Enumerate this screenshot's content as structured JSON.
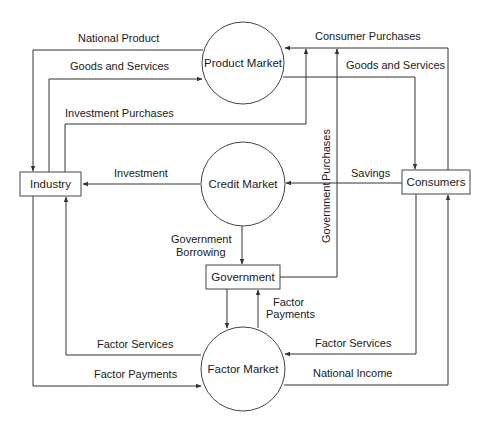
{
  "diagram": {
    "type": "circular-flow",
    "colors": {
      "line": "#333333",
      "background": "#ffffff",
      "text": "#1a1a1a"
    },
    "nodes": {
      "product_market": {
        "label": "Product Market",
        "shape": "circle"
      },
      "credit_market": {
        "label": "Credit Market",
        "shape": "circle"
      },
      "factor_market": {
        "label": "Factor Market",
        "shape": "circle"
      },
      "industry": {
        "label": "Industry",
        "shape": "box"
      },
      "consumers": {
        "label": "Consumers",
        "shape": "box"
      },
      "government": {
        "label": "Government",
        "shape": "box"
      }
    },
    "flows": {
      "national_product": {
        "label": "National Product",
        "from": "Product Market",
        "to": "Industry"
      },
      "goods_services_left": {
        "label": "Goods and Services",
        "from": "Industry",
        "to": "Product Market"
      },
      "investment_purchases": {
        "label": "Investment Purchases",
        "from": "Industry",
        "to": "Product Market"
      },
      "consumer_purchases": {
        "label": "Consumer Purchases",
        "from": "Consumers",
        "to": "Product Market"
      },
      "goods_services_right": {
        "label": "Goods and Services",
        "from": "Product Market",
        "to": "Consumers"
      },
      "government_purchases_1": {
        "label": "Government",
        "from": "Government",
        "to": "Product Market"
      },
      "government_purchases_2": {
        "label": "Purchases"
      },
      "savings": {
        "label": "Savings",
        "from": "Consumers",
        "to": "Credit Market"
      },
      "investment": {
        "label": "Investment",
        "from": "Credit Market",
        "to": "Industry"
      },
      "gov_borrowing_1": {
        "label": "Government",
        "from": "Credit Market",
        "to": "Government"
      },
      "gov_borrowing_2": {
        "label": "Borrowing"
      },
      "factor_payments_gov_1": {
        "label": "Factor",
        "from": "Factor Market",
        "to": "Government"
      },
      "factor_payments_gov_2": {
        "label": "Payments"
      },
      "factor_services_left": {
        "label": "Factor Services",
        "from": "Factor Market",
        "to": "Industry"
      },
      "factor_payments_left": {
        "label": "Factor Payments",
        "from": "Industry",
        "to": "Factor Market"
      },
      "factor_services_right": {
        "label": "Factor Services",
        "from": "Consumers",
        "to": "Factor Market"
      },
      "national_income": {
        "label": "National Income",
        "from": "Factor Market",
        "to": "Consumers"
      }
    }
  }
}
